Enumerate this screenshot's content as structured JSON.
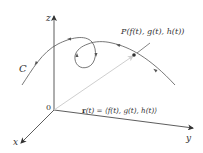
{
  "figure": {
    "type": "space-curve-position-vector",
    "axes": {
      "x_label": "x",
      "y_label": "y",
      "z_label": "z",
      "origin_label": "0"
    },
    "curve": {
      "label": "C"
    },
    "point": {
      "label_prefix": "P",
      "label_coords": "(f(t), g(t), h(t))"
    },
    "vector": {
      "label_prefix": "r",
      "label_arg": "(t)",
      "label_eq": " = ⟨f(t), g(t), h(t)⟩"
    },
    "colors": {
      "axis": "#333333",
      "curve": "#555555",
      "vector": "#cfcfcf",
      "text": "#333333"
    }
  }
}
